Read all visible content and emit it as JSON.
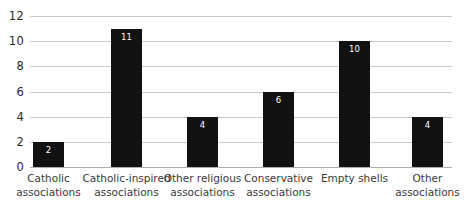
{
  "chart_data": {
    "type": "bar",
    "title": "",
    "subtitle": "",
    "xlabel": "",
    "ylabel": "",
    "categories": [
      "Catholic associations",
      "Catholic-inspired associations",
      "Other religious associations",
      "Conservative associations",
      "Empty shells",
      "Other associations"
    ],
    "category_lines": [
      [
        "Catholic",
        "associations"
      ],
      [
        "Catholic-inspired",
        "associations"
      ],
      [
        "Other religious",
        "associations"
      ],
      [
        "Conservative",
        "associations"
      ],
      [
        "Empty shells"
      ],
      [
        "Other",
        "associations"
      ]
    ],
    "values": [
      2,
      11,
      4,
      6,
      10,
      4
    ],
    "value_labels": [
      "2",
      "11",
      "4",
      "6",
      "10",
      "4"
    ],
    "ylim": [
      0,
      12
    ],
    "yticks": [
      0,
      2,
      4,
      6,
      8,
      10,
      12
    ],
    "ytick_labels": [
      "0",
      "2",
      "4",
      "6",
      "8",
      "10",
      "12"
    ],
    "grid": true,
    "grid_axis": "y",
    "legend": false,
    "legend_position": "none",
    "bar_color": "#111111",
    "grid_color": "#c9c9c9",
    "value_label_color": "#ffffff",
    "tick_label_color": "#2b2b2b",
    "background_color": "#ffffff"
  }
}
